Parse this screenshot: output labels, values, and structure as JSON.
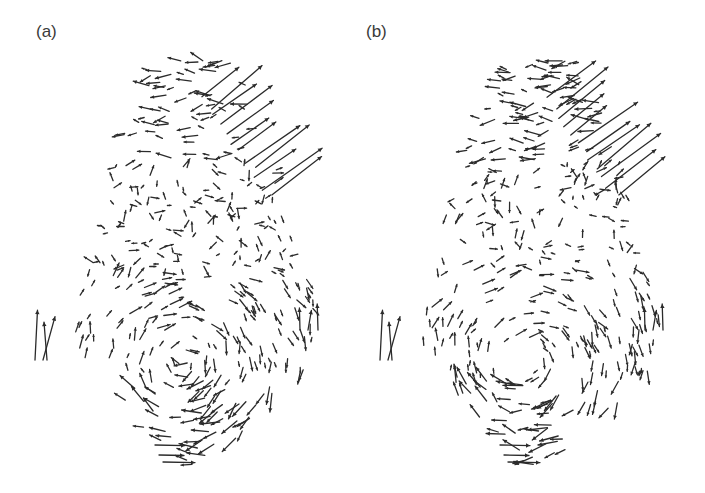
{
  "figure": {
    "panels": [
      {
        "id": "a",
        "label": "(a)",
        "offset_x": 0,
        "seed": 11
      },
      {
        "id": "b",
        "label": "(b)",
        "offset_x": -8,
        "seed": 23
      }
    ],
    "arrow_color": "#2b2b2b",
    "background": "#ffffff"
  }
}
